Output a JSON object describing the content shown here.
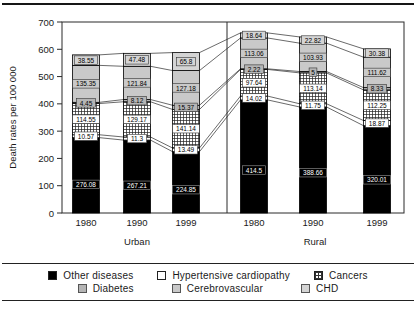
{
  "chart_data": {
    "type": "bar",
    "stacked": true,
    "title": "",
    "ylabel": "Death rates per 100 000",
    "ylim": [
      0,
      700
    ],
    "y_ticks": [
      0,
      100,
      200,
      300,
      400,
      500,
      600,
      700
    ],
    "grid": false,
    "legend_position": "bottom",
    "panels": [
      {
        "label": "Urban",
        "years": [
          "1980",
          "1990",
          "1999"
        ]
      },
      {
        "label": "Rural",
        "years": [
          "1980",
          "1990",
          "1999"
        ]
      }
    ],
    "categories": [
      "Urban 1980",
      "Urban 1990",
      "Urban 1999",
      "Rural 1980",
      "Rural 1990",
      "Rural 1999"
    ],
    "series": [
      {
        "name": "Other diseases",
        "fill": "black",
        "values": [
          276.08,
          267.21,
          224.85,
          414.5,
          388.66,
          320.01
        ]
      },
      {
        "name": "Hypertensive cardiopathy",
        "fill": "white",
        "values": [
          10.57,
          11.3,
          13.49,
          14.02,
          11.75,
          18.87
        ]
      },
      {
        "name": "Cancers",
        "fill": "crosshatch",
        "values": [
          114.55,
          129.17,
          141.14,
          97.64,
          113.14,
          112.25
        ]
      },
      {
        "name": "Diabetes",
        "fill": "#b5b5b5",
        "values": [
          4.45,
          8.12,
          15.37,
          2.22,
          5,
          8.33
        ]
      },
      {
        "name": "Cerebrovascular",
        "fill": "#c9c9c9",
        "values": [
          135.35,
          121.84,
          127.18,
          113.06,
          103.93,
          111.62
        ]
      },
      {
        "name": "CHD",
        "fill": "#d4d4d4",
        "values": [
          38.55,
          47.48,
          65.8,
          18.64,
          22.82,
          30.38
        ]
      }
    ],
    "bar_totals": [
      579.55,
      585.12,
      587.81,
      660.08,
      645.3,
      601.46
    ],
    "connector_lines": true
  },
  "axis": {
    "y_label": "Death rates per 100 000",
    "y_tick_labels": [
      "0",
      "100",
      "200",
      "300",
      "400",
      "500",
      "600",
      "700"
    ],
    "x_tick_labels": [
      "1980",
      "1990",
      "1999",
      "1980",
      "1990",
      "1999"
    ],
    "panel_labels": [
      "Urban",
      "Rural"
    ]
  },
  "legend": {
    "items": [
      {
        "label": "Other diseases",
        "swatch": "black"
      },
      {
        "label": "Hypertensive cardiopathy",
        "swatch": "white"
      },
      {
        "label": "Cancers",
        "swatch": "crosshatch"
      },
      {
        "label": "Diabetes",
        "swatch": "gray-medium"
      },
      {
        "label": "Cerebrovascular",
        "swatch": "gray-light"
      },
      {
        "label": "CHD",
        "swatch": "gray-lighter"
      }
    ]
  },
  "colors": {
    "frame": "#2a2a2a",
    "connector": "#2a2a2a",
    "bar_stroke": "#000000",
    "diabetes_gray": "#b5b5b5",
    "cerebrovascular_gray": "#c9c9c9",
    "chd_gray": "#d4d4d4",
    "text": "#1a1a1a"
  }
}
